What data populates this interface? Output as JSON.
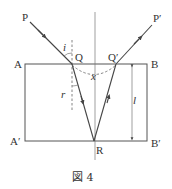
{
  "figure": {
    "caption": "図 4",
    "caption_word": "図",
    "caption_number": "4",
    "points": {
      "P": "P",
      "P_prime": "P′",
      "Q": "Q",
      "Q_prime": "Q′",
      "A": "A",
      "B": "B",
      "A_prime": "A′",
      "B_prime": "B′",
      "R": "R"
    },
    "quantities": {
      "incidence_angle": "i",
      "refraction_angle": "r",
      "separation": "x",
      "thickness": "l"
    }
  }
}
